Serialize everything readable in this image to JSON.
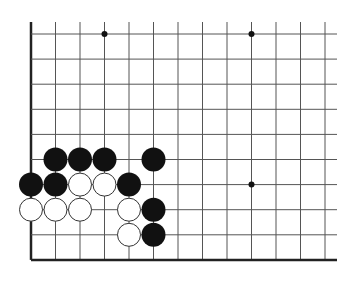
{
  "board": {
    "description": "Go board fragment (lower-left corner region)",
    "columns": 13,
    "rows": 10,
    "origin_x": 31,
    "origin_y": 34,
    "spacing_x": 24.5,
    "spacing_y": 25.1,
    "top_open_y": 22,
    "right_open_x": 337,
    "left_edge": true,
    "bottom_edge": true,
    "line_color": "#555555",
    "edge_color": "#222222",
    "star_points": [
      [
        3,
        0
      ],
      [
        9,
        0
      ],
      [
        9,
        6
      ]
    ],
    "black_stones": [
      [
        1,
        5
      ],
      [
        2,
        5
      ],
      [
        3,
        5
      ],
      [
        5,
        5
      ],
      [
        0,
        6
      ],
      [
        1,
        6
      ],
      [
        4,
        6
      ],
      [
        5,
        7
      ],
      [
        5,
        8
      ]
    ],
    "white_stones": [
      [
        2,
        6
      ],
      [
        3,
        6
      ],
      [
        0,
        7
      ],
      [
        1,
        7
      ],
      [
        2,
        7
      ],
      [
        4,
        7
      ],
      [
        4,
        8
      ]
    ],
    "colors": {
      "black": "#111111",
      "white": "#ffffff",
      "stone_outline": "#333333"
    }
  }
}
